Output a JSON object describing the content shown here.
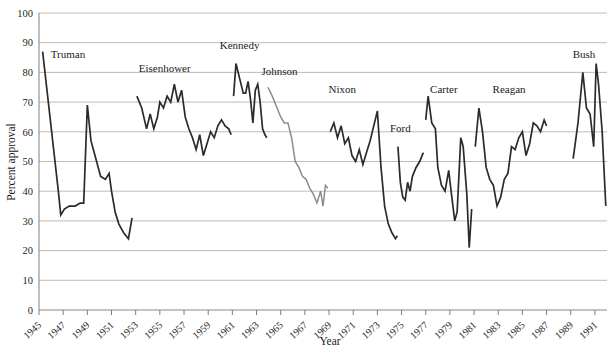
{
  "chart_data": {
    "type": "line",
    "title": "",
    "xlabel": "Year",
    "ylabel": "Percent approval",
    "xlim": [
      1945,
      1992
    ],
    "ylim": [
      0,
      100
    ],
    "ytick_step": 10,
    "grid": true,
    "legend_position": "inline-annotations",
    "yticks": [
      "0",
      "10",
      "20",
      "30",
      "40",
      "50",
      "60",
      "70",
      "80",
      "90",
      "100"
    ],
    "xticks": [
      "1945",
      "1947",
      "1949",
      "1951",
      "1953",
      "1955",
      "1957",
      "1959",
      "1961",
      "1963",
      "1965",
      "1967",
      "1969",
      "1971",
      "1973",
      "1975",
      "1977",
      "1979",
      "1981",
      "1983",
      "1985",
      "1987",
      "1989",
      "1991"
    ],
    "colors": {
      "dark": "#2b2b2b",
      "gray": "#8c8c8c",
      "grid": "#b4b4b4",
      "axis": "#8a8a8a",
      "background": "#ffffff"
    },
    "annotations": [
      {
        "text": "Truman",
        "x": 1947.4,
        "y": 85
      },
      {
        "text": "Eisenhower",
        "x": 1955.4,
        "y": 80
      },
      {
        "text": "Kennedy",
        "x": 1961.6,
        "y": 88
      },
      {
        "text": "Johnson",
        "x": 1964.9,
        "y": 79
      },
      {
        "text": "Nixon",
        "x": 1970.1,
        "y": 73
      },
      {
        "text": "Ford",
        "x": 1974.9,
        "y": 60
      },
      {
        "text": "Carter",
        "x": 1978.5,
        "y": 73
      },
      {
        "text": "Reagan",
        "x": 1983.9,
        "y": 73
      },
      {
        "text": "Bush",
        "x": 1990.1,
        "y": 85
      }
    ],
    "series": [
      {
        "name": "Truman",
        "color": "#2b2b2b",
        "x": [
          1945.3,
          1946.6,
          1946.8,
          1947.1,
          1947.5,
          1948.0,
          1948.4,
          1948.7,
          1949.0,
          1949.3,
          1949.7,
          1950.1,
          1950.5,
          1950.8,
          1951.0,
          1951.3,
          1951.6,
          1952.0,
          1952.4,
          1952.7
        ],
        "values": [
          87,
          40,
          32,
          34,
          35,
          35,
          36,
          36,
          69,
          57,
          51,
          45,
          44,
          46,
          40,
          33,
          29,
          26,
          24,
          31
        ]
      },
      {
        "name": "Eisenhower",
        "color": "#2b2b2b",
        "x": [
          1953.1,
          1953.5,
          1953.9,
          1954.2,
          1954.5,
          1954.8,
          1955.0,
          1955.3,
          1955.6,
          1955.9,
          1956.2,
          1956.5,
          1956.8,
          1957.1,
          1957.4,
          1957.7,
          1958.0,
          1958.3,
          1958.6,
          1958.9,
          1959.2,
          1959.5,
          1959.8,
          1960.1,
          1960.4,
          1960.7,
          1960.9
        ],
        "values": [
          72,
          68,
          61,
          66,
          61,
          65,
          70,
          68,
          72,
          70,
          76,
          70,
          74,
          65,
          61,
          58,
          54,
          59,
          52,
          56,
          60,
          58,
          62,
          64,
          62,
          61,
          59
        ]
      },
      {
        "name": "Kennedy",
        "color": "#2b2b2b",
        "x": [
          1961.1,
          1961.3,
          1961.6,
          1961.9,
          1962.1,
          1962.3,
          1962.5,
          1962.7,
          1962.9,
          1963.1,
          1963.3,
          1963.5,
          1963.7,
          1963.85
        ],
        "values": [
          72,
          83,
          78,
          73,
          73,
          77,
          71,
          63,
          74,
          76,
          70,
          61,
          59,
          58
        ]
      },
      {
        "name": "Johnson",
        "color": "#8c8c8c",
        "x": [
          1963.95,
          1964.3,
          1964.7,
          1965.0,
          1965.3,
          1965.6,
          1965.9,
          1966.2,
          1966.5,
          1966.8,
          1967.1,
          1967.4,
          1967.7,
          1968.0,
          1968.3,
          1968.5,
          1968.7,
          1968.9
        ],
        "values": [
          75,
          72,
          68,
          65,
          63,
          63,
          58,
          50,
          48,
          45,
          44,
          41,
          39,
          36,
          40,
          35,
          42,
          41
        ]
      },
      {
        "name": "Nixon",
        "color": "#2b2b2b",
        "x": [
          1969.1,
          1969.4,
          1969.7,
          1970.0,
          1970.3,
          1970.6,
          1970.9,
          1971.2,
          1971.5,
          1971.8,
          1972.1,
          1972.4,
          1972.7,
          1973.0,
          1973.3,
          1973.6,
          1973.9,
          1974.2,
          1974.5,
          1974.65
        ],
        "values": [
          60,
          63,
          58,
          62,
          56,
          58,
          52,
          50,
          54,
          49,
          53,
          57,
          62,
          67,
          48,
          35,
          29,
          26,
          24,
          25
        ]
      },
      {
        "name": "Ford",
        "color": "#2b2b2b",
        "x": [
          1974.7,
          1974.9,
          1975.1,
          1975.3,
          1975.5,
          1975.7,
          1975.9,
          1976.2,
          1976.5,
          1976.8
        ],
        "values": [
          55,
          43,
          38,
          37,
          43,
          40,
          45,
          48,
          50,
          53
        ]
      },
      {
        "name": "Carter",
        "color": "#2b2b2b",
        "x": [
          1977.0,
          1977.2,
          1977.5,
          1977.8,
          1978.0,
          1978.3,
          1978.6,
          1978.9,
          1979.1,
          1979.4,
          1979.6,
          1979.9,
          1980.1,
          1980.4,
          1980.6,
          1980.8
        ],
        "values": [
          64,
          72,
          63,
          61,
          48,
          42,
          40,
          47,
          40,
          30,
          33,
          58,
          55,
          39,
          21,
          34
        ]
      },
      {
        "name": "Reagan",
        "color": "#2b2b2b",
        "x": [
          1981.1,
          1981.4,
          1981.7,
          1982.0,
          1982.3,
          1982.6,
          1982.9,
          1983.2,
          1983.5,
          1983.8,
          1984.1,
          1984.4,
          1984.7,
          1985.0,
          1985.3,
          1985.6,
          1985.9,
          1986.2,
          1986.5,
          1986.8,
          1987.0
        ],
        "values": [
          55,
          68,
          60,
          48,
          44,
          42,
          35,
          38,
          44,
          46,
          55,
          54,
          58,
          60,
          52,
          56,
          63,
          62,
          60,
          64,
          62
        ]
      },
      {
        "name": "Bush",
        "color": "#2b2b2b",
        "x": [
          1989.2,
          1989.6,
          1990.0,
          1990.3,
          1990.6,
          1990.9,
          1991.1,
          1991.3,
          1991.6,
          1991.9
        ],
        "values": [
          51,
          63,
          80,
          68,
          66,
          55,
          83,
          76,
          60,
          35
        ]
      }
    ]
  }
}
